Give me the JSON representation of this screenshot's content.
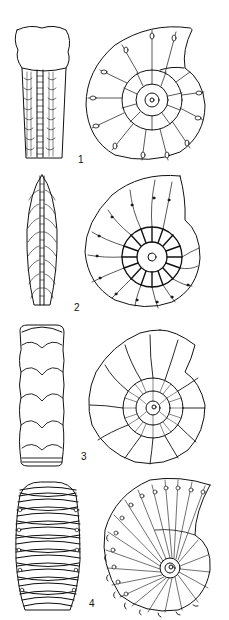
{
  "figure": {
    "type": "scientific-illustration",
    "background": "#ffffff",
    "ink": "#111111"
  },
  "specimens": [
    {
      "label": "1",
      "views": [
        "ventral",
        "lateral"
      ]
    },
    {
      "label": "2",
      "views": [
        "ventral",
        "lateral"
      ]
    },
    {
      "label": "3",
      "views": [
        "ventral",
        "lateral"
      ]
    },
    {
      "label": "4",
      "views": [
        "ventral",
        "lateral"
      ]
    }
  ]
}
